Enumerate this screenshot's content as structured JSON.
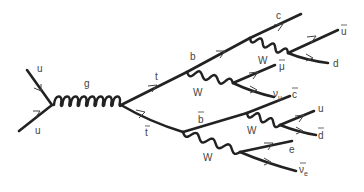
{
  "diagram": {
    "colors": {
      "line": "#222222",
      "label": "#444444",
      "background": "#ffffff"
    },
    "labels": {
      "u_in_top": "u",
      "u_in_bottom": "u",
      "g": "g",
      "t": "t",
      "tbar": "t",
      "b": "b",
      "w1": "W",
      "c": "c",
      "w2": "W",
      "ubar": "u",
      "d": "d",
      "mubar": "μ",
      "numu": "ν",
      "numu_sub": "μ",
      "bbar": "b",
      "w3": "W",
      "cbar": "c",
      "u_out": "u",
      "dbar": "d",
      "w4": "W",
      "e": "e",
      "nuebar": "ν",
      "nuebar_sub": "e"
    },
    "particles": [
      {
        "id": "u_in_top",
        "type": "fermion",
        "name": "up quark"
      },
      {
        "id": "u_in_bottom",
        "type": "fermion",
        "name": "up quark"
      },
      {
        "id": "g",
        "type": "gluon",
        "name": "gluon"
      },
      {
        "id": "t",
        "type": "fermion",
        "name": "top quark"
      },
      {
        "id": "tbar",
        "type": "fermion",
        "name": "anti-top quark"
      },
      {
        "id": "b",
        "type": "fermion",
        "name": "bottom quark"
      },
      {
        "id": "w1",
        "type": "boson",
        "name": "W boson"
      },
      {
        "id": "c",
        "type": "fermion",
        "name": "charm quark"
      },
      {
        "id": "w2",
        "type": "boson",
        "name": "W boson"
      },
      {
        "id": "ubar",
        "type": "fermion",
        "name": "anti-up quark"
      },
      {
        "id": "d",
        "type": "fermion",
        "name": "down quark"
      },
      {
        "id": "mubar",
        "type": "fermion",
        "name": "anti-muon"
      },
      {
        "id": "numu",
        "type": "fermion",
        "name": "muon neutrino"
      },
      {
        "id": "bbar",
        "type": "fermion",
        "name": "anti-bottom quark"
      },
      {
        "id": "w3",
        "type": "boson",
        "name": "W boson"
      },
      {
        "id": "cbar",
        "type": "fermion",
        "name": "anti-charm quark"
      },
      {
        "id": "u_out",
        "type": "fermion",
        "name": "up quark"
      },
      {
        "id": "dbar",
        "type": "fermion",
        "name": "anti-down quark"
      },
      {
        "id": "w4",
        "type": "boson",
        "name": "W boson"
      },
      {
        "id": "e",
        "type": "fermion",
        "name": "electron"
      },
      {
        "id": "nuebar",
        "type": "fermion",
        "name": "anti-electron neutrino"
      }
    ]
  }
}
